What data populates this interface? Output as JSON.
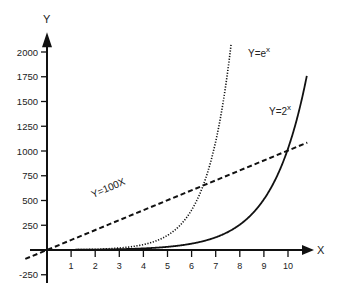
{
  "chart_data": {
    "type": "line",
    "title": "",
    "xlabel": "X",
    "ylabel": "Y",
    "x_ticks": [
      1,
      2,
      3,
      4,
      5,
      6,
      7,
      8,
      9,
      10
    ],
    "y_ticks": [
      -250,
      250,
      500,
      750,
      1000,
      1250,
      1500,
      1750,
      2000
    ],
    "xlim": [
      -1.0,
      11
    ],
    "ylim": [
      -350,
      2150
    ],
    "grid": false,
    "series": [
      {
        "name": "Y=e^x",
        "label_base": "Y=e",
        "label_exp": "x",
        "style": "dotted",
        "function": "exp(x)"
      },
      {
        "name": "Y=2^x",
        "label_base": "Y=2",
        "label_exp": "x",
        "style": "solid",
        "function": "2^x"
      },
      {
        "name": "Y=100X",
        "label_base": "Y=100X",
        "label_exp": "",
        "style": "dashed",
        "function": "100*x"
      }
    ],
    "sample_points": {
      "Y=e^x": {
        "x": [
          0,
          2,
          4,
          5,
          6,
          6.6,
          7,
          7.6
        ],
        "y": [
          1,
          7.4,
          54.6,
          148.4,
          403.4,
          735,
          1096.6,
          1998
        ]
      },
      "Y=2^x": {
        "x": [
          0,
          4,
          6,
          8,
          9,
          10,
          10.7
        ],
        "y": [
          1,
          16,
          64,
          256,
          512,
          1024,
          1663
        ]
      },
      "Y=100X": {
        "x": [
          -1,
          0,
          6.6,
          10,
          10.8
        ],
        "y": [
          -100,
          0,
          660,
          1000,
          1080
        ]
      }
    }
  }
}
